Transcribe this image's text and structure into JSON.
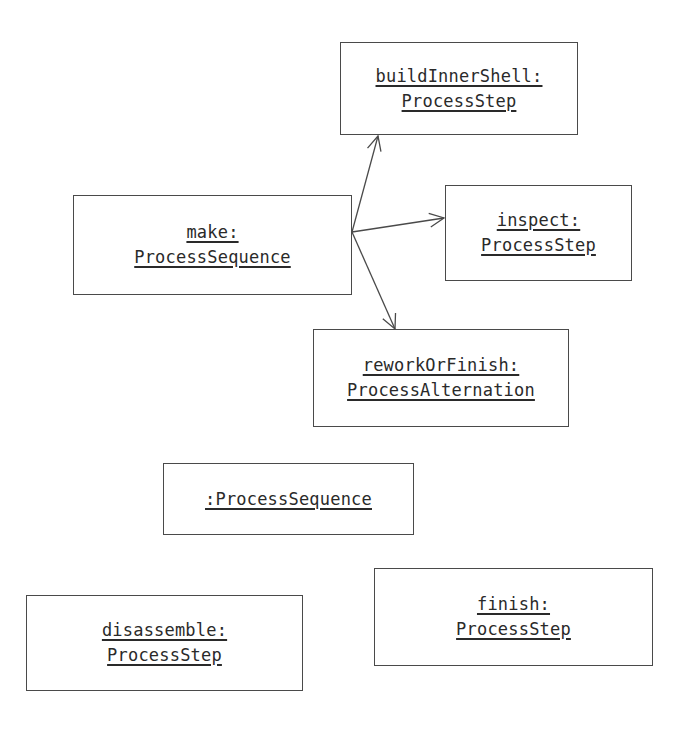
{
  "diagram": {
    "type": "UML object diagram",
    "objects": [
      {
        "id": "buildInnerShell",
        "line1": "buildInnerShell:",
        "line2": "ProcessStep",
        "box": [
          340,
          42,
          238,
          93
        ]
      },
      {
        "id": "make",
        "line1": "make:",
        "line2": "ProcessSequence",
        "box": [
          73,
          195,
          279,
          100
        ]
      },
      {
        "id": "inspect",
        "line1": "inspect:",
        "line2": "ProcessStep",
        "box": [
          445,
          185,
          187,
          96
        ]
      },
      {
        "id": "reworkOrFinish",
        "line1": "reworkOrFinish:",
        "line2": "ProcessAlternation",
        "box": [
          313,
          329,
          256,
          98
        ]
      },
      {
        "id": "anonymousSequence",
        "line1": ":ProcessSequence",
        "line2": "",
        "box": [
          163,
          463,
          251,
          72
        ]
      },
      {
        "id": "disassemble",
        "line1": "disassemble:",
        "line2": "ProcessStep",
        "box": [
          26,
          595,
          277,
          96
        ]
      },
      {
        "id": "finish",
        "line1": "finish:",
        "line2": "ProcessStep",
        "box": [
          374,
          568,
          279,
          98
        ]
      }
    ],
    "links": [
      {
        "from": "make",
        "to": "buildInnerShell",
        "start": [
          352,
          232
        ],
        "end": [
          378,
          136
        ]
      },
      {
        "from": "make",
        "to": "inspect",
        "start": [
          352,
          232
        ],
        "end": [
          444,
          218
        ]
      },
      {
        "from": "make",
        "to": "reworkOrFinish",
        "start": [
          352,
          232
        ],
        "end": [
          395,
          329
        ]
      }
    ],
    "colors": {
      "line": "#4a4a4a",
      "text": "#2a2a2a",
      "background": "#ffffff"
    }
  }
}
